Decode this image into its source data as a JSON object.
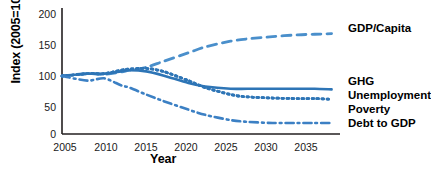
{
  "chart_data": {
    "type": "line",
    "title": "",
    "xlabel": "Year",
    "ylabel": "Index (2005=100)",
    "xlim": [
      2005,
      2038
    ],
    "ylim": [
      0,
      215
    ],
    "xticks": [
      2005,
      2010,
      2015,
      2020,
      2025,
      2030,
      2035
    ],
    "yticks": [
      0,
      50,
      100,
      150,
      200
    ],
    "grid": false,
    "legend_position": "right-inline",
    "accent_color": "#2E75B6",
    "x": [
      2005,
      2008,
      2010,
      2012,
      2013,
      2015,
      2017,
      2020,
      2022,
      2025,
      2027,
      2030,
      2033,
      2035,
      2037
    ],
    "series": [
      {
        "name": "GDP/Capita",
        "label": "GDP/Capita",
        "style": "dashed",
        "color": "#4A8FCB",
        "values": [
          100,
          104,
          103,
          107,
          110,
          115,
          125,
          140,
          150,
          160,
          164,
          168,
          171,
          172,
          173
        ],
        "label_x": 2037,
        "label_y": 172
      },
      {
        "name": "GHG",
        "label": "GHG",
        "style": "solid",
        "color": "#2E75B6",
        "values": [
          100,
          104,
          104,
          108,
          110,
          108,
          101,
          88,
          82,
          78,
          78,
          78,
          78,
          78,
          77
        ],
        "label_x": 2037,
        "label_y": 80
      },
      {
        "name": "Unemployment",
        "label": "Unemployment",
        "style": "dotted",
        "color": "#2E75B6",
        "values": [
          100,
          104,
          104,
          110,
          112,
          113,
          108,
          92,
          80,
          68,
          64,
          62,
          61,
          61,
          60
        ],
        "label_x": 2037,
        "label_y": 64
      },
      {
        "name": "Poverty",
        "label": "Poverty",
        "style": "dotted",
        "color": "#2E75B6",
        "values": [
          100,
          104,
          104,
          110,
          112,
          113,
          108,
          92,
          80,
          68,
          64,
          62,
          61,
          61,
          60
        ],
        "label_x": 2037,
        "label_y": 48
      },
      {
        "name": "Debt to GDP",
        "label": "Debt to GDP",
        "style": "dashdot",
        "color": "#3C80C4",
        "values": [
          100,
          92,
          96,
          84,
          80,
          68,
          57,
          42,
          33,
          24,
          21,
          19,
          19,
          19,
          19
        ],
        "label_x": 2037,
        "label_y": 20
      }
    ]
  },
  "axes": {
    "y_ticks": [
      "200",
      "150",
      "100",
      "50",
      "0"
    ],
    "x_ticks": [
      "2005",
      "2010",
      "2015",
      "2020",
      "2025",
      "2030",
      "2035"
    ],
    "y_title": "Index (2005=100)",
    "x_title": "Year"
  },
  "labels": {
    "gdp_per_capita": "GDP/Capita",
    "ghg": "GHG",
    "unemployment": "Unemployment",
    "poverty": "Poverty",
    "debt_to_gdp": "Debt to GDP"
  }
}
